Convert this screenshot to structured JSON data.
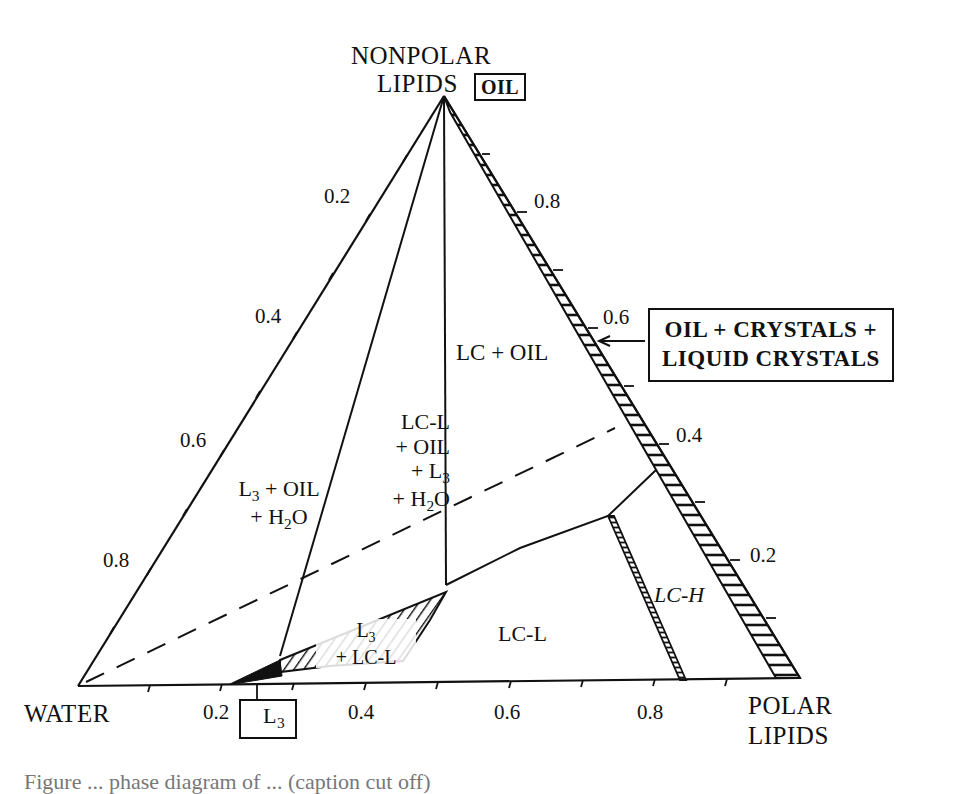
{
  "figure": {
    "vertices": {
      "top": {
        "line1": "NONPOLAR",
        "line2": "LIPIDS",
        "box": "OIL"
      },
      "bottom_left": {
        "label": "WATER"
      },
      "bottom_right": {
        "line1": "POLAR",
        "line2": "LIPIDS"
      }
    },
    "ticks": {
      "left_edge": [
        "0.2",
        "0.4",
        "0.6",
        "0.8"
      ],
      "right_edge": [
        "0.8",
        "0.6",
        "0.4",
        "0.2"
      ],
      "base": [
        "0.2",
        "0.4",
        "0.6",
        "0.8"
      ]
    },
    "regions": {
      "lc_oil": "LC + OIL",
      "l3_oil_h2o": {
        "line1": "L3 + OIL",
        "line2": "+ H2O"
      },
      "lcl_oil_l3_h2o": {
        "line1": "LC-L",
        "line2": "+ OIL",
        "line3": "+ L3",
        "line4": "+ H2O"
      },
      "l3_lcl": {
        "line1": "L3",
        "line2": "+ LC-L"
      },
      "lc_l": "LC-L",
      "lc_h": "LC-H"
    },
    "callouts": {
      "oil_crystals": {
        "line1": "OIL + CRYSTALS +",
        "line2": "LIQUID CRYSTALS"
      },
      "l3_box": "L3"
    },
    "caption_partial": "Figure ... phase diagram of ... (caption cut off)"
  },
  "chart_data": {
    "type": "ternary-phase-diagram",
    "title": "",
    "components": [
      "NONPOLAR LIPIDS (OIL)",
      "WATER",
      "POLAR LIPIDS"
    ],
    "axis_ticks": [
      0.2,
      0.4,
      0.6,
      0.8
    ],
    "regions": [
      "LC + OIL",
      "L3 + OIL + H2O",
      "LC-L + OIL + L3 + H2O",
      "L3 + LC-L",
      "LC-L",
      "LC-H",
      "OIL + CRYSTALS + LIQUID CRYSTALS"
    ],
    "boxed_labels": [
      "OIL",
      "L3",
      "OIL + CRYSTALS + LIQUID CRYSTALS"
    ],
    "dashed_line": true,
    "grid": false
  }
}
